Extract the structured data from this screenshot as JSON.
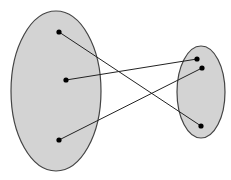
{
  "diagram": {
    "type": "function-mapping",
    "colors": {
      "set_fill": "#d3d3d3",
      "stroke": "#444444",
      "point": "#000000",
      "background": "#ffffff"
    },
    "domain_set": {
      "cx": 56,
      "cy": 91,
      "rx": 45,
      "ry": 80,
      "points": [
        {
          "x": 59,
          "y": 32
        },
        {
          "x": 66,
          "y": 80
        },
        {
          "x": 59,
          "y": 140
        }
      ]
    },
    "codomain_set": {
      "cx": 201,
      "cy": 92,
      "rx": 24,
      "ry": 46,
      "points": [
        {
          "x": 197,
          "y": 59
        },
        {
          "x": 202,
          "y": 68
        },
        {
          "x": 201,
          "y": 126
        }
      ]
    },
    "mappings": [
      {
        "from": 0,
        "to": 2
      },
      {
        "from": 1,
        "to": 0
      },
      {
        "from": 2,
        "to": 1
      }
    ]
  }
}
